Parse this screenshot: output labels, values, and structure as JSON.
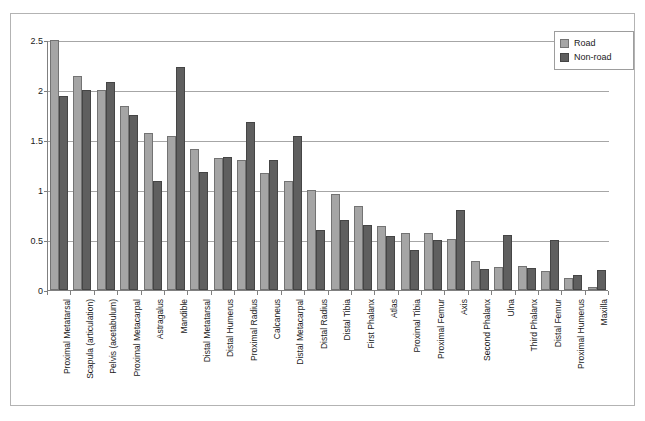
{
  "chart_data": {
    "type": "bar",
    "title": "",
    "xlabel": "",
    "ylabel": "",
    "ylim": [
      0,
      2.5
    ],
    "yticks": [
      "0",
      "0.5",
      "1",
      "1.5",
      "2",
      "2.5"
    ],
    "ytick_values": [
      0,
      0.5,
      1,
      1.5,
      2,
      2.5
    ],
    "grid": true,
    "legend_position": "top-right",
    "categories": [
      "Proximal Metatarsal",
      "Scapula (articulation)",
      "Pelvis (acetabulum)",
      "Proximal Metacarpal",
      "Astragalus",
      "Mandible",
      "Distal Metatarsal",
      "Distal Humerus",
      "Proximal Radius",
      "Calcaneus",
      "Distal Metacarpal",
      "Distal Radius",
      "Distal Tibia",
      "First Phalanx",
      "Atlas",
      "Proximal Tibia",
      "Proximal Femur",
      "Axis",
      "Second Phalanx",
      "Ulna",
      "Third Phalanx",
      "Distal Femur",
      "Proximal Humerus",
      "Maxilla"
    ],
    "series": [
      {
        "name": "Road",
        "color": "#a5a5a5",
        "values": [
          2.5,
          2.14,
          2.0,
          1.84,
          1.57,
          1.54,
          1.41,
          1.32,
          1.3,
          1.17,
          1.09,
          1.0,
          0.96,
          0.84,
          0.64,
          0.57,
          0.57,
          0.51,
          0.29,
          0.23,
          0.24,
          0.19,
          0.12,
          0.03
        ]
      },
      {
        "name": "Non-road",
        "color": "#5f5f5f",
        "values": [
          1.94,
          2.0,
          2.08,
          1.75,
          1.09,
          2.23,
          1.18,
          1.33,
          1.68,
          1.3,
          1.54,
          0.6,
          0.7,
          0.65,
          0.54,
          0.4,
          0.5,
          0.8,
          0.21,
          0.55,
          0.22,
          0.5,
          0.15,
          0.2
        ]
      }
    ]
  },
  "legend": {
    "items": [
      {
        "label": "Road",
        "swatch": "road"
      },
      {
        "label": "Non-road",
        "swatch": "nonroad"
      }
    ]
  }
}
